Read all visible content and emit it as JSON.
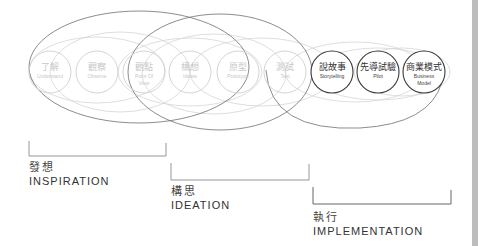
{
  "nodes": [
    {
      "zh": "了解",
      "en": "Understand",
      "cx": 50,
      "style": "light"
    },
    {
      "zh": "觀察",
      "en": "Observe",
      "cx": 97,
      "style": "light"
    },
    {
      "zh": "觀點",
      "en": "Point Of View",
      "en1": "Point Of",
      "en2": "View",
      "cx": 144,
      "style": "light"
    },
    {
      "zh": "構想",
      "en": "Ideate",
      "cx": 190,
      "style": "light"
    },
    {
      "zh": "原型",
      "en": "Prototype",
      "cx": 238,
      "style": "light"
    },
    {
      "zh": "測試",
      "en": "Test",
      "cx": 285,
      "style": "light"
    },
    {
      "zh": "說故事",
      "en": "Storytelling",
      "cx": 332,
      "style": "dark"
    },
    {
      "zh": "先導試驗",
      "en": "Pilot",
      "cx": 378,
      "style": "dark"
    },
    {
      "zh": "商業模式",
      "en": "Business Model",
      "en1": "Business",
      "en2": "Model",
      "cx": 424,
      "style": "dark"
    }
  ],
  "phases": [
    {
      "zh": "發想",
      "en": "INSPIRATION"
    },
    {
      "zh": "構思",
      "en": "IDEATION"
    },
    {
      "zh": "執行",
      "en": "IMPLEMENTATION"
    }
  ],
  "colors": {
    "light_circle": "#cfcfcf",
    "dark_circle": "#3a3a3a",
    "big_ellipse": "#6e6e6e",
    "bracket": "#8a8a8a",
    "sidebar": "#bdbdbd"
  }
}
